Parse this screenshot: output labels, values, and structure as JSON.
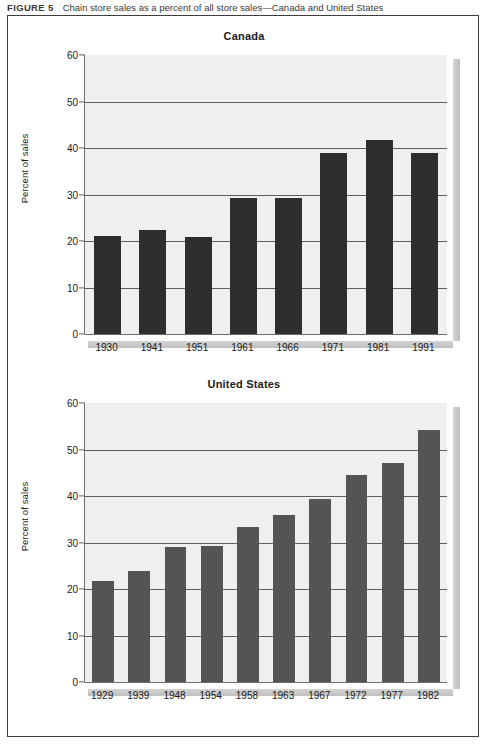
{
  "figure": {
    "label": "FIGURE 5",
    "title": "Chain store sales as a percent of all store sales—Canada and United States"
  },
  "colors": {
    "bar_canada": "#2e2e2e",
    "bar_us": "#545454",
    "plot_background": "#efefef",
    "gridline": "#5f5f5f",
    "axis": "#6e6e6e",
    "frame": "#3e3e3e"
  },
  "chart_data": [
    {
      "id": "canada",
      "type": "bar",
      "title": "Canada",
      "xlabel": "",
      "ylabel": "Percent of sales",
      "ylim": [
        0,
        60
      ],
      "yticks": [
        0,
        10,
        20,
        30,
        40,
        50,
        60
      ],
      "grid": true,
      "legend": "none",
      "bar_color": "#2e2e2e",
      "categories": [
        "1930",
        "1941",
        "1951",
        "1961",
        "1966",
        "1971",
        "1981",
        "1991"
      ],
      "values": [
        21.0,
        22.4,
        20.8,
        29.2,
        29.3,
        38.9,
        41.8,
        38.9
      ]
    },
    {
      "id": "united-states",
      "type": "bar",
      "title": "United States",
      "xlabel": "",
      "ylabel": "Percent of sales",
      "ylim": [
        0,
        60
      ],
      "yticks": [
        0,
        10,
        20,
        30,
        40,
        50,
        60
      ],
      "grid": true,
      "legend": "none",
      "bar_color": "#545454",
      "categories": [
        "1929",
        "1939",
        "1948",
        "1954",
        "1958",
        "1963",
        "1967",
        "1972",
        "1977",
        "1982"
      ],
      "values": [
        21.8,
        23.8,
        29.0,
        29.2,
        33.4,
        35.9,
        39.4,
        44.5,
        47.2,
        54.2
      ]
    }
  ]
}
